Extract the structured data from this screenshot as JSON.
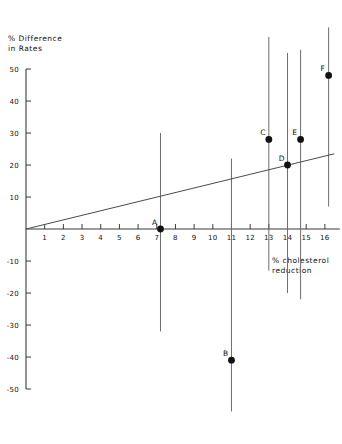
{
  "chart_data": {
    "type": "scatter",
    "title": "",
    "xlabel": "% cholesterol\nreduction",
    "ylabel": "% Difference\nin Rates",
    "xlim": [
      0,
      16.8
    ],
    "ylim": [
      -50,
      50
    ],
    "grid": false,
    "legend": "none",
    "xticks": [
      1,
      2,
      3,
      4,
      5,
      6,
      7,
      8,
      9,
      10,
      11,
      12,
      13,
      14,
      15,
      16
    ],
    "yticks": [
      50,
      40,
      30,
      20,
      10,
      -10,
      -20,
      -30,
      -40,
      -50
    ],
    "series": [
      {
        "name": "trials",
        "points": [
          {
            "label": "A",
            "x": 7.2,
            "y": 0,
            "y_low": -32,
            "y_high": 30
          },
          {
            "label": "B",
            "x": 11.0,
            "y": -41,
            "y_low": -57,
            "y_high": 22
          },
          {
            "label": "C",
            "x": 13.0,
            "y": 28,
            "y_low": -13,
            "y_high": 60
          },
          {
            "label": "D",
            "x": 14.0,
            "y": 20,
            "y_low": -20,
            "y_high": 55
          },
          {
            "label": "E",
            "x": 14.7,
            "y": 28,
            "y_low": -22,
            "y_high": 56
          },
          {
            "label": "F",
            "x": 16.2,
            "y": 48,
            "y_low": 7,
            "y_high": 63
          }
        ]
      }
    ],
    "fit_line": {
      "name": "regression line",
      "x_start": 0,
      "y_start": 0,
      "x_end": 16.5,
      "y_end": 23.5
    }
  },
  "axes": {
    "y_title_line1": "% Difference",
    "y_title_line2": "in Rates",
    "x_title_line1": "% cholesterol",
    "x_title_line2": "reduction"
  }
}
